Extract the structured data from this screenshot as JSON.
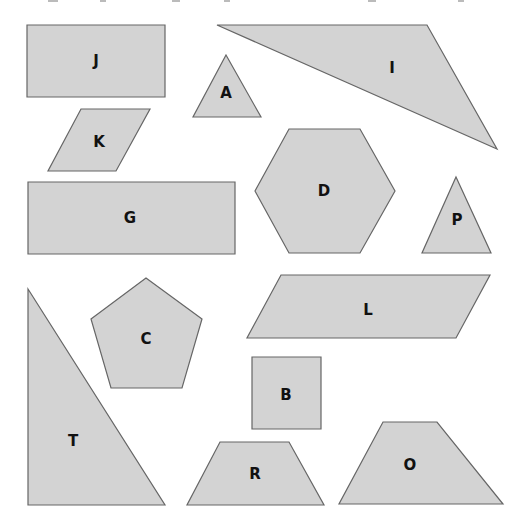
{
  "page": {
    "background": "#ffffff",
    "fill_color": "#d3d3d3",
    "stroke_color": "#666666",
    "label_color": "#111111"
  },
  "shapes": [
    {
      "id": "J",
      "label": "J",
      "kind": "rectangle",
      "points": "27,25 165,25 165,97 27,97",
      "label_pos": [
        96,
        61
      ]
    },
    {
      "id": "I",
      "label": "I",
      "kind": "triangle",
      "points": "217,25 427,25 497,149",
      "label_pos": [
        392,
        68
      ]
    },
    {
      "id": "A",
      "label": "A",
      "kind": "triangle",
      "points": "226,55 261,117 193,117",
      "label_pos": [
        226,
        93
      ]
    },
    {
      "id": "K",
      "label": "K",
      "kind": "parallelogram",
      "points": "81,109 150,109 116,171 48,171",
      "label_pos": [
        99,
        142
      ]
    },
    {
      "id": "G",
      "label": "G",
      "kind": "rectangle",
      "points": "28,182 235,182 235,254 28,254",
      "label_pos": [
        130,
        218
      ]
    },
    {
      "id": "D",
      "label": "D",
      "kind": "hexagon",
      "points": "289,129 360,129 395,191 360,253 289,253 255,191",
      "label_pos": [
        324,
        191
      ]
    },
    {
      "id": "P",
      "label": "P",
      "kind": "triangle",
      "points": "456,177 491,253 422,253",
      "label_pos": [
        457,
        220
      ]
    },
    {
      "id": "L",
      "label": "L",
      "kind": "parallelogram",
      "points": "281,275 490,275 456,338 247,338",
      "label_pos": [
        368,
        310
      ]
    },
    {
      "id": "C",
      "label": "C",
      "kind": "pentagon",
      "points": "146,278 202,319 182,388 111,388 91,319",
      "label_pos": [
        146,
        339
      ]
    },
    {
      "id": "T",
      "label": "T",
      "kind": "right-triangle",
      "points": "28,289 165,505 28,505",
      "label_pos": [
        73,
        441
      ]
    },
    {
      "id": "B",
      "label": "B",
      "kind": "square",
      "points": "252,357 321,357 321,429 252,429",
      "label_pos": [
        286,
        395
      ]
    },
    {
      "id": "R",
      "label": "R",
      "kind": "trapezoid",
      "points": "220,442 289,442 324,505 187,505",
      "label_pos": [
        255,
        474
      ]
    },
    {
      "id": "O",
      "label": "O",
      "kind": "trapezoid",
      "points": "383,422 437,422 503,504 339,504",
      "label_pos": [
        410,
        465
      ]
    }
  ]
}
